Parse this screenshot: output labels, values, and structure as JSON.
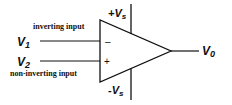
{
  "diagram": {
    "type": "op-amp symbol",
    "inputs": [
      {
        "name": "V",
        "sub": "1",
        "description": "inverting input",
        "sign": "–"
      },
      {
        "name": "V",
        "sub": "2",
        "description": "non-inverting input",
        "sign": "+"
      }
    ],
    "output": {
      "name": "V",
      "sub": "0"
    },
    "supplies": {
      "positive": {
        "prefix": "+V",
        "sub": "s"
      },
      "negative": {
        "prefix": "-V",
        "sub": "s"
      }
    },
    "colors": {
      "stroke": "#111111",
      "background": "#ffffff"
    }
  }
}
